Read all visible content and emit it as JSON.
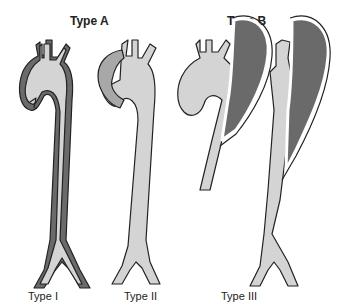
{
  "groups": [
    {
      "label": "Type A"
    },
    {
      "label": "Type B"
    }
  ],
  "types": [
    {
      "label": "Type I"
    },
    {
      "label": "Type II"
    },
    {
      "label": "Type III"
    }
  ],
  "colors": {
    "lumen": "#d4d4d4",
    "false_lumen": "#6a6a6a",
    "aneurysm": "#a8a8a8",
    "outline": "#222222",
    "background": "#ffffff"
  }
}
